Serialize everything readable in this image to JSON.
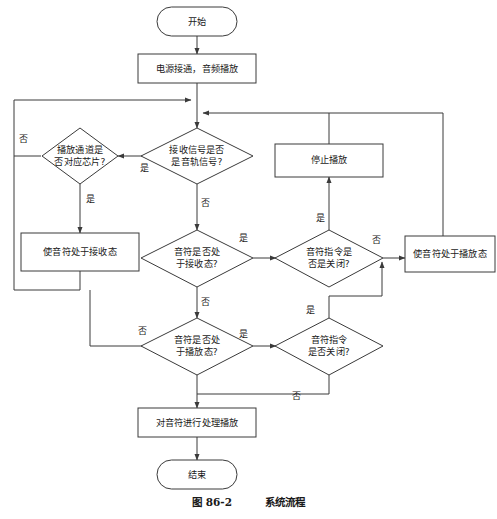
{
  "figure": {
    "caption_number": "图 86-2",
    "caption_title": "系统流程",
    "language": "zh-CN",
    "colors": {
      "background": "#ffffff",
      "stroke": "#3a3a3a",
      "text": "#1a1a1a"
    }
  },
  "diagram_data": {
    "type": "flowchart",
    "orientation": "top-to-bottom",
    "nodes": [
      {
        "id": "start",
        "shape": "terminator",
        "label": "开始"
      },
      {
        "id": "power_on",
        "shape": "process",
        "label": "电源接通，音频播放"
      },
      {
        "id": "d_channel",
        "shape": "decision",
        "label_line1": "播放通道是",
        "label_line2": "否对应芯片?"
      },
      {
        "id": "d_signal",
        "shape": "decision",
        "label_line1": "接收信号是否",
        "label_line2": "是音轨信号?"
      },
      {
        "id": "stop_play",
        "shape": "process",
        "label": "停止播放"
      },
      {
        "id": "set_receive",
        "shape": "process",
        "label": "使音符处于接收态"
      },
      {
        "id": "d_recv_state",
        "shape": "decision",
        "label_line1": "音符是否处",
        "label_line2": "于接收态?"
      },
      {
        "id": "d_cmd_off_1",
        "shape": "decision",
        "label_line1": "音符指令是",
        "label_line2": "否是关闭?"
      },
      {
        "id": "set_play",
        "shape": "process",
        "label": "使音符处于播放态"
      },
      {
        "id": "d_play_state",
        "shape": "decision",
        "label_line1": "音符是否处",
        "label_line2": "于播放态?"
      },
      {
        "id": "d_cmd_off_2",
        "shape": "decision",
        "label_line1": "音符指令",
        "label_line2": "是否关闭?"
      },
      {
        "id": "process_play",
        "shape": "process",
        "label": "对音符进行处理播放"
      },
      {
        "id": "end",
        "shape": "terminator",
        "label": "结束"
      }
    ],
    "edge_labels": {
      "channel_no": "否",
      "channel_yes": "是",
      "signal_yes": "是",
      "signal_no": "否",
      "recv_yes": "是",
      "recv_no": "否",
      "cmd1_yes": "是",
      "cmd1_no": "否",
      "play_no": "否",
      "play_yes": "是",
      "cmd2_yes": "是",
      "cmd2_no": "否"
    }
  }
}
